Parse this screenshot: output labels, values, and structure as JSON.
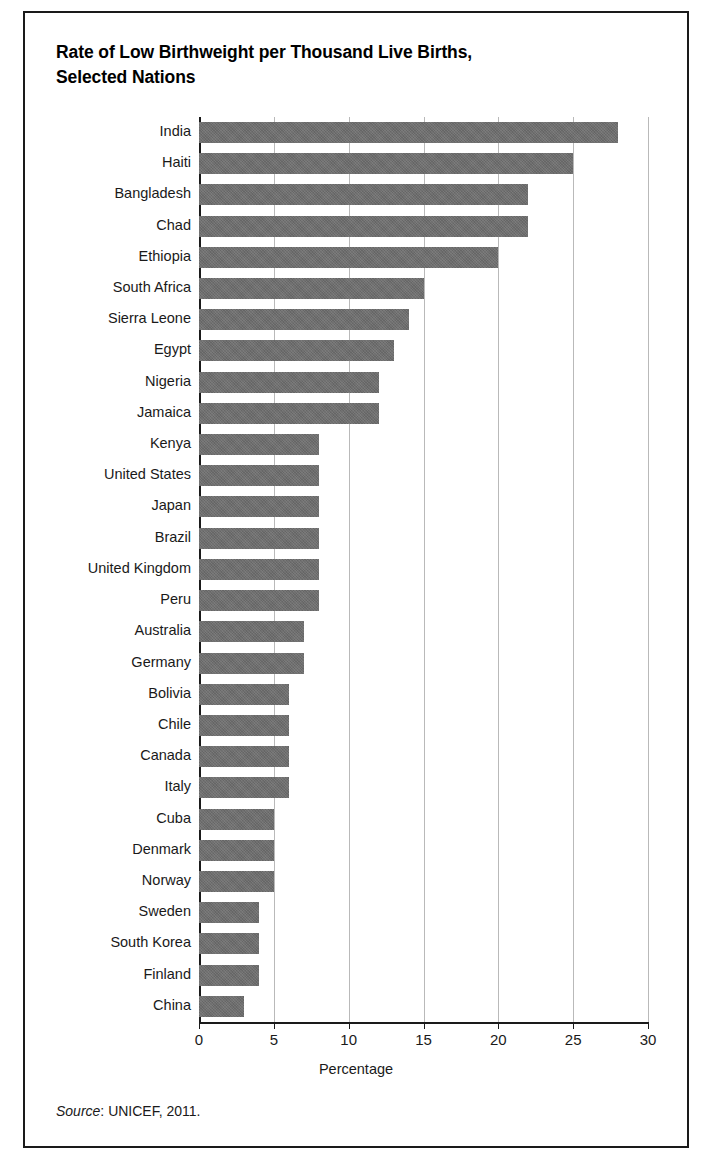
{
  "figure": {
    "title": "Rate of Low Birthweight per Thousand Live Births, Selected Nations",
    "title_line1": "Rate of Low Birthweight per Thousand Live Births,",
    "title_line2": "Selected Nations",
    "source_label": "Source",
    "source_text": ": UNICEF, 2011.",
    "bar_color": "#6e6e6e",
    "grid_color": "#b9b9b9",
    "axis_color": "#1a1a1a"
  },
  "chart_data": {
    "type": "bar",
    "orientation": "horizontal",
    "title": "Rate of Low Birthweight per Thousand Live Births, Selected Nations",
    "xlabel": "Percentage",
    "ylabel": "",
    "xlim": [
      0,
      30
    ],
    "xticks": [
      0,
      5,
      10,
      15,
      20,
      25,
      30
    ],
    "grid": "vertical",
    "legend": "none",
    "categories": [
      "India",
      "Haiti",
      "Bangladesh",
      "Chad",
      "Ethiopia",
      "South Africa",
      "Sierra Leone",
      "Egypt",
      "Nigeria",
      "Jamaica",
      "Kenya",
      "United States",
      "Japan",
      "Brazil",
      "United Kingdom",
      "Peru",
      "Australia",
      "Germany",
      "Bolivia",
      "Chile",
      "Canada",
      "Italy",
      "Cuba",
      "Denmark",
      "Norway",
      "Sweden",
      "South Korea",
      "Finland",
      "China"
    ],
    "values": [
      28,
      25,
      22,
      22,
      20,
      15,
      14,
      13,
      12,
      12,
      8,
      8,
      8,
      8,
      8,
      8,
      7,
      7,
      6,
      6,
      6,
      6,
      5,
      5,
      5,
      4,
      4,
      4,
      3
    ],
    "source": "Source: UNICEF, 2011."
  }
}
